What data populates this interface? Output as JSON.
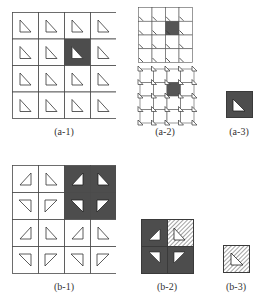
{
  "colors": {
    "line": "#4a4a4a",
    "dark_fill": "#4d4d4d",
    "light_fill": "#ffffff",
    "hatch": "#8a8a8a"
  },
  "panels": {
    "a1": {
      "label": "(a-1)",
      "rows": 4,
      "cols": 4,
      "dark_cells": [
        [
          1,
          2
        ]
      ],
      "triangle": "right-angle-lower-right-pointing-down-right"
    },
    "a2": {
      "label": "(a-2)",
      "top": {
        "rows": 4,
        "cols": 4,
        "dark_cells": [
          [
            1,
            2
          ]
        ],
        "marker": "slash-tick"
      },
      "bottom": {
        "rows": 4,
        "cols": 4,
        "dark_cells": [
          [
            1,
            2
          ]
        ],
        "marker": "triangle-at-nodes"
      }
    },
    "a3": {
      "label": "(a-3)",
      "fill": "dark",
      "triangle": "white"
    },
    "b1": {
      "label": "(b-1)",
      "rows": 4,
      "cols": 4,
      "dark_block": [
        [
          0,
          2
        ],
        [
          0,
          3
        ],
        [
          1,
          2
        ],
        [
          1,
          3
        ]
      ]
    },
    "b2": {
      "label": "(b-2)",
      "cells": [
        "dark",
        "hatched",
        "dark",
        "dark"
      ]
    },
    "b3": {
      "label": "(b-3)",
      "fill": "hatched"
    }
  }
}
